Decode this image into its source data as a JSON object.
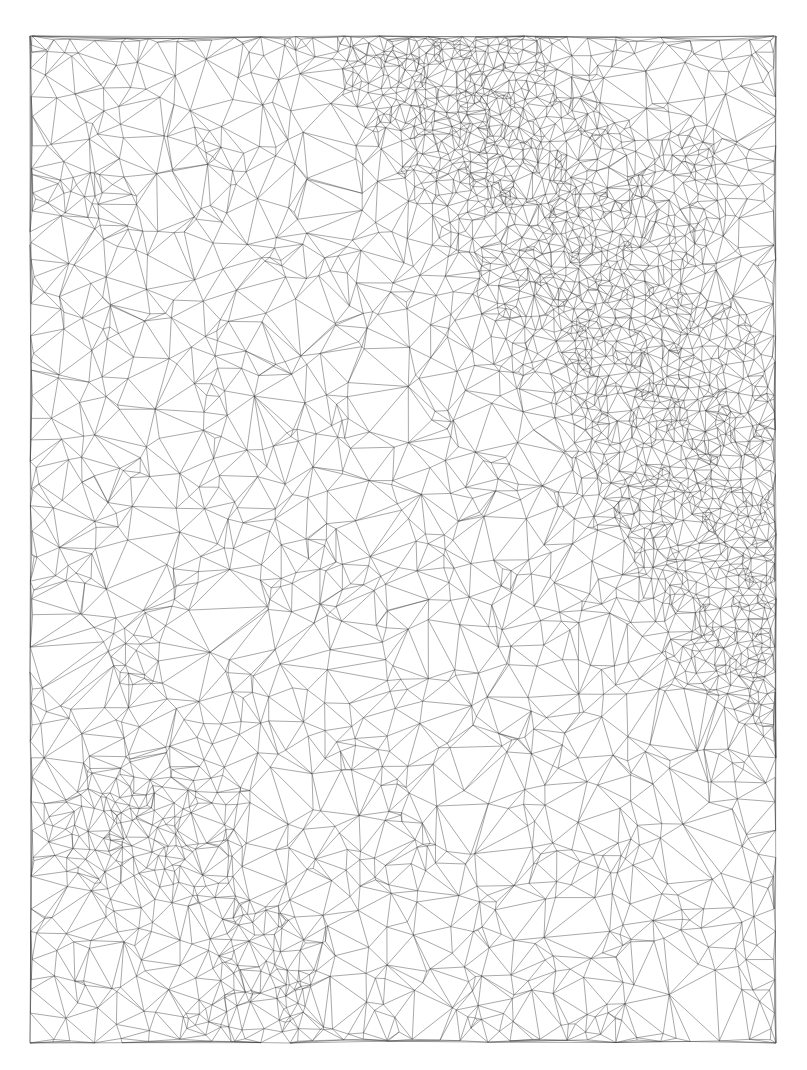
{
  "diagram": {
    "type": "triangulated-irregular-network-mesh",
    "canvas": {
      "width": 807,
      "height": 1070,
      "background": "#ffffff"
    },
    "mesh_bounds": {
      "left": 30,
      "top": 36,
      "right": 776,
      "bottom": 1043
    },
    "line_color": "#3a3a3a",
    "features": [
      {
        "name": "dense-ridge-band",
        "description": "dense fine triangulation along a diagonal band from top-center to right edge",
        "path": [
          [
            440,
            40
          ],
          [
            480,
            120
          ],
          [
            560,
            220
          ],
          [
            630,
            330
          ],
          [
            690,
            440
          ],
          [
            740,
            540
          ],
          [
            776,
            620
          ]
        ],
        "width": 110
      },
      {
        "name": "dense-cluster-bottom-left",
        "center": [
          250,
          960
        ],
        "radius": 90
      },
      {
        "name": "concentric-cluster-left",
        "center": [
          150,
          830
        ],
        "radius": 110
      },
      {
        "name": "concentric-cluster-top-right",
        "center": [
          690,
          180
        ],
        "radius": 90
      }
    ],
    "text_labels": []
  }
}
